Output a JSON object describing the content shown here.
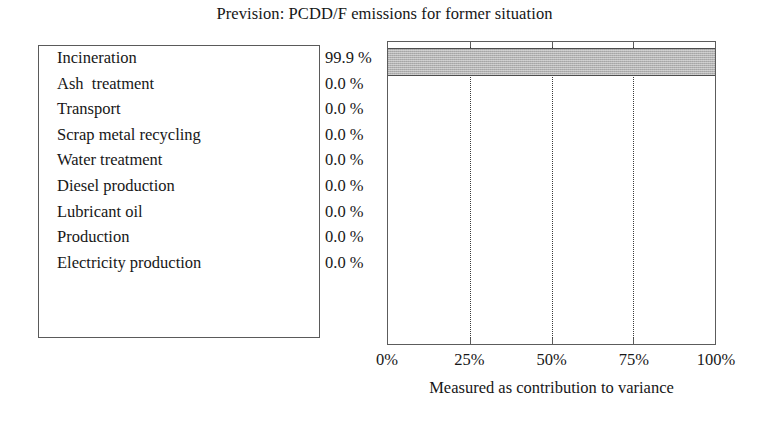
{
  "chart_data": {
    "type": "bar",
    "orientation": "horizontal",
    "title": "Prevision: PCDD/F emissions for former situation",
    "xlabel": "Measured as contribution to variance",
    "ylabel": "",
    "xlim": [
      0,
      100
    ],
    "x_tick_labels": [
      "0%",
      "25%",
      "50%",
      "75%",
      "100%"
    ],
    "x_tick_values": [
      0,
      25,
      50,
      75,
      100
    ],
    "grid": "vertical-dotted",
    "gridline_values": [
      25,
      50,
      75
    ],
    "legend_position": "left-panel",
    "bar_color": "#b2b2b2",
    "categories": [
      "Incineration",
      "Ash  treatment",
      "Transport",
      "Scrap metal recycling",
      "Water treatment",
      "Diesel production",
      "Lubricant oil",
      "Production",
      "Electricity production"
    ],
    "values": [
      99.9,
      0.0,
      0.0,
      0.0,
      0.0,
      0.0,
      0.0,
      0.0,
      0.0
    ],
    "value_labels": [
      "99.9 %",
      "0.0 %",
      "0.0 %",
      "0.0 %",
      "0.0 %",
      "0.0 %",
      "0.0 %",
      "0.0 %",
      "0.0 %"
    ]
  }
}
